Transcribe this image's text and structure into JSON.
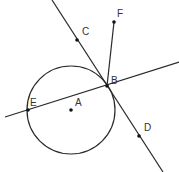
{
  "diagram": {
    "type": "geometry",
    "stroke_color": "#2a2a2a",
    "label_color": "#333333",
    "circle": {
      "name": "A",
      "cx": 71,
      "cy": 110,
      "r": 44
    },
    "lines": [
      {
        "name": "tangent-line",
        "x1": 52,
        "y1": 0,
        "x2": 163,
        "y2": 172,
        "through": [
          "C",
          "B",
          "D"
        ]
      },
      {
        "name": "secant-line",
        "x1": 5,
        "y1": 117,
        "x2": 179,
        "y2": 62,
        "through": [
          "E",
          "B"
        ]
      },
      {
        "name": "segment-BF",
        "x1": 107,
        "y1": 86,
        "x2": 114,
        "y2": 22,
        "through": [
          "B",
          "F"
        ]
      }
    ],
    "points": [
      {
        "label": "A",
        "x": 71,
        "y": 110,
        "lx": 75,
        "ly": 106
      },
      {
        "label": "B",
        "x": 107,
        "y": 86,
        "lx": 111,
        "ly": 84
      },
      {
        "label": "C",
        "x": 77,
        "y": 40,
        "lx": 82,
        "ly": 35
      },
      {
        "label": "D",
        "x": 139,
        "y": 136,
        "lx": 144,
        "ly": 131
      },
      {
        "label": "E",
        "x": 28,
        "y": 110,
        "lx": 30,
        "ly": 106
      },
      {
        "label": "F",
        "x": 114,
        "y": 22,
        "lx": 117,
        "ly": 17
      }
    ]
  }
}
